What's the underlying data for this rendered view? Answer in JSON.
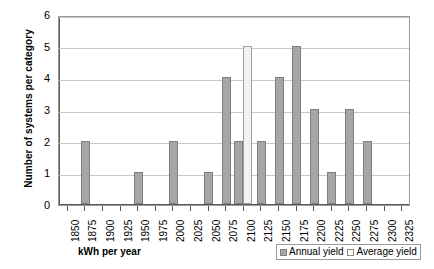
{
  "chart_data": {
    "type": "bar",
    "title": "",
    "xlabel": "kWh per year",
    "ylabel": "Number of systems per category",
    "ylim": [
      0,
      6
    ],
    "yticks": [
      "0",
      "1",
      "2",
      "3",
      "4",
      "5",
      "6"
    ],
    "grid": true,
    "legend_position": "bottom-right",
    "categories": [
      "1850",
      "1875",
      "1900",
      "1925",
      "1950",
      "1975",
      "2000",
      "2025",
      "2050",
      "2075",
      "2100",
      "2125",
      "2150",
      "2175",
      "2200",
      "2225",
      "2250",
      "2275",
      "2300",
      "2325"
    ],
    "series": [
      {
        "name": "Annual yield",
        "color": "#a6a6a6",
        "values": [
          0,
          2,
          0,
          0,
          1,
          0,
          2,
          0,
          1,
          4,
          2,
          2,
          4,
          5,
          3,
          1,
          3,
          2,
          0,
          0
        ]
      },
      {
        "name": "Average yield",
        "color": "#f2f2f2",
        "values": [
          0,
          0,
          0,
          0,
          0,
          0,
          0,
          0,
          0,
          0,
          5,
          0,
          0,
          0,
          0,
          0,
          0,
          0,
          0,
          0
        ]
      }
    ]
  },
  "legend": {
    "items": [
      {
        "label": "Annual yield"
      },
      {
        "label": "Average yield"
      }
    ]
  }
}
